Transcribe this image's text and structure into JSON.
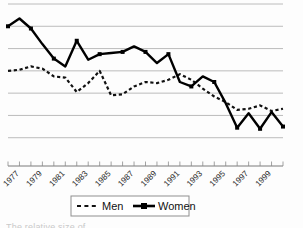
{
  "figure": {
    "background_color": "#fdfdfd",
    "plot_area": {
      "left": 8,
      "top": 4,
      "right": 283,
      "bottom": 160
    },
    "caption_cut_off": "The relative size of"
  },
  "chart_data": {
    "type": "line",
    "title": "",
    "subtitle": "",
    "xlabel": "",
    "ylabel": "",
    "grid": true,
    "gridlines": 7,
    "legend_position": "bottom",
    "line_color": "#000000",
    "x": [
      1976,
      1977,
      1978,
      1979,
      1980,
      1981,
      1982,
      1983,
      1984,
      1985,
      1986,
      1987,
      1988,
      1989,
      1990,
      1991,
      1992,
      1993,
      1994,
      1995,
      1996,
      1997,
      1998,
      1999,
      2000
    ],
    "tick_labels": [
      "1977",
      "1979",
      "1981",
      "1983",
      "1985",
      "1987",
      "1989",
      "1991",
      "1993",
      "1995",
      "1997",
      "1999"
    ],
    "tick_label_years": [
      1977,
      1979,
      1981,
      1983,
      1985,
      1987,
      1989,
      1991,
      1993,
      1995,
      1997,
      1999
    ],
    "tick_label_rotation": -45,
    "ylim": [
      0,
      7
    ],
    "yticks": [
      1,
      2,
      3,
      4,
      5,
      6,
      7
    ],
    "series": [
      {
        "name": "Men",
        "style": "dashed",
        "marker": "none",
        "values": [
          4.0,
          4.05,
          4.2,
          4.1,
          3.75,
          3.7,
          3.05,
          3.45,
          4.0,
          2.9,
          2.95,
          3.3,
          3.5,
          3.45,
          3.6,
          3.85,
          3.6,
          3.2,
          2.85,
          2.6,
          2.25,
          2.3,
          2.45,
          2.2,
          2.3
        ]
      },
      {
        "name": "Women",
        "style": "solid",
        "marker": "square",
        "values": [
          6.0,
          6.35,
          5.9,
          5.2,
          4.55,
          4.2,
          5.35,
          4.5,
          4.75,
          4.8,
          4.85,
          5.1,
          4.85,
          4.35,
          4.75,
          3.5,
          3.3,
          3.75,
          3.5,
          2.55,
          1.45,
          2.1,
          1.4,
          2.15,
          1.5
        ]
      }
    ],
    "legend": [
      {
        "label": "Men",
        "style": "dashed",
        "marker": "none",
        "color": "#000000"
      },
      {
        "label": "Women",
        "style": "solid",
        "marker": "square",
        "color": "#000000"
      }
    ]
  }
}
